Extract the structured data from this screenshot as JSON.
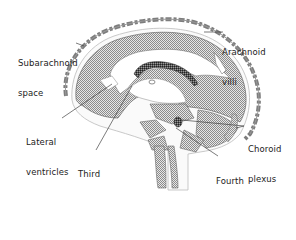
{
  "diagram": {
    "labels": {
      "subarachnoid_space": {
        "line1": "Subarachnoid",
        "line2": "space"
      },
      "arachnoid_villi": {
        "line1": "Arachnoid",
        "line2": "villi"
      },
      "lateral_ventricles": {
        "line1": "Lateral",
        "line2": "ventricles"
      },
      "third_ventricle": {
        "line1": "Third",
        "line2": "ventricle"
      },
      "choroid_plexus": {
        "line1": "Choroid",
        "line2": "plexus"
      },
      "fourth_ventricle": {
        "line1": "Fourth",
        "line2": "ventricle"
      }
    },
    "colors": {
      "outline": "#555555",
      "hatch": "#9a9a9a",
      "membrane": "#777777",
      "plexus": "#333333",
      "text": "#222222"
    }
  }
}
